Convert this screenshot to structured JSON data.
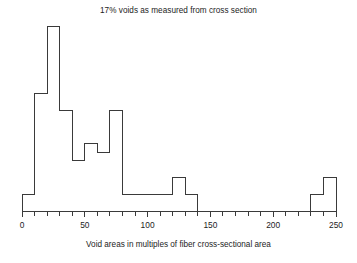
{
  "chart_data": {
    "type": "bar",
    "title": "17% voids as measured from cross section",
    "xlabel": "Void areas in multiples of fiber cross-sectional area",
    "ylabel": "",
    "grid": false,
    "legend": "none",
    "bin_width": 10,
    "xlim": [
      0,
      250
    ],
    "ylim": [
      0,
      11.5
    ],
    "xticks": [
      0,
      50,
      100,
      150,
      200,
      250
    ],
    "xticklabels": [
      "0",
      "50",
      "100",
      "150",
      "200",
      "250"
    ],
    "minor_tick_interval": 10,
    "categories": [
      "0-10",
      "10-20",
      "20-30",
      "30-40",
      "40-50",
      "50-60",
      "60-70",
      "70-80",
      "80-90",
      "90-100",
      "100-110",
      "110-120",
      "120-130",
      "130-140",
      "140-150",
      "150-160",
      "160-170",
      "170-180",
      "180-190",
      "190-200",
      "200-210",
      "210-220",
      "220-230",
      "230-240",
      "240-250"
    ],
    "bin_starts": [
      0,
      10,
      20,
      30,
      40,
      50,
      60,
      70,
      80,
      90,
      100,
      110,
      120,
      130,
      140,
      150,
      160,
      170,
      180,
      190,
      200,
      210,
      220,
      230,
      240
    ],
    "values": [
      1,
      7,
      11,
      6,
      3,
      4,
      3.5,
      6,
      1,
      1,
      1,
      1,
      2,
      1,
      0,
      0,
      0,
      0,
      0,
      0,
      0,
      0,
      0,
      1,
      2
    ],
    "bar_fill": "#ffffff",
    "bar_stroke": "#3a3a3a",
    "axis_color": "#3a3a3a"
  }
}
